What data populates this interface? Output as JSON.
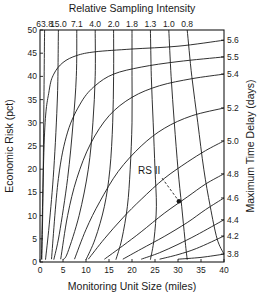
{
  "chart_data": {
    "type": "line",
    "title": "Relative Sampling Intensity",
    "xlabel": "Monitoring Unit Size (miles)",
    "ylabel": "Economic Risk (pct)",
    "y2label": "Maximum Time Delay (days)",
    "xlim": [
      0,
      40
    ],
    "ylim": [
      0,
      50
    ],
    "grid": false,
    "x_ticks": [
      0,
      5,
      10,
      15,
      20,
      25,
      30,
      35,
      40
    ],
    "x_tick_labels": [
      "0",
      "5",
      "10",
      "15",
      "20",
      "25",
      "30",
      "35",
      "40"
    ],
    "y_ticks": [
      0,
      5,
      10,
      15,
      20,
      25,
      30,
      35,
      40,
      45,
      50
    ],
    "y_tick_labels": [
      "0",
      "5",
      "10",
      "15",
      "20",
      "25",
      "30",
      "35",
      "40",
      "45",
      "50"
    ],
    "top_axis": {
      "label": "Relative Sampling Intensity",
      "tick_labels": [
        "63.8",
        "15.0",
        "7.1",
        "4.0",
        "2.0",
        "1.8",
        "1.3",
        "1.0",
        "0.8"
      ],
      "tick_x_miles": [
        1,
        4,
        8,
        12,
        16,
        20,
        24,
        28,
        32
      ]
    },
    "right_axis": {
      "label": "Maximum Time Delay (days)",
      "tick_labels": [
        "5.6",
        "5.5",
        "5.4",
        "5.2",
        "5.0",
        "4.8",
        "4.6",
        "4.4",
        "4.2",
        "3.8"
      ],
      "tick_y_pct": [
        47.8,
        44.2,
        40.5,
        33.2,
        26.1,
        19.0,
        13.8,
        9.1,
        5.6,
        1.7
      ]
    },
    "series_time_delay": [
      {
        "name": "5.6",
        "points": [
          [
            0.3,
            0.6
          ],
          [
            1,
            28
          ],
          [
            2,
            37
          ],
          [
            3,
            40.5
          ],
          [
            5,
            43
          ],
          [
            8,
            44.5
          ],
          [
            12,
            45.3
          ],
          [
            20,
            45.9
          ],
          [
            30,
            46.5
          ],
          [
            40,
            47.8
          ]
        ]
      },
      {
        "name": "5.5",
        "points": [
          [
            2.5,
            0.6
          ],
          [
            4,
            18
          ],
          [
            6,
            28
          ],
          [
            9,
            34.5
          ],
          [
            12,
            38
          ],
          [
            16,
            40.5
          ],
          [
            22,
            42
          ],
          [
            30,
            43.2
          ],
          [
            40,
            44.2
          ]
        ]
      },
      {
        "name": "5.4",
        "points": [
          [
            4.5,
            0.6
          ],
          [
            6,
            10
          ],
          [
            8,
            18
          ],
          [
            11,
            25.5
          ],
          [
            15,
            31.5
          ],
          [
            20,
            35.5
          ],
          [
            26,
            38
          ],
          [
            33,
            39.5
          ],
          [
            40,
            40.5
          ]
        ]
      },
      {
        "name": "5.2",
        "points": [
          [
            7.5,
            0.6
          ],
          [
            10,
            7
          ],
          [
            13,
            13
          ],
          [
            17,
            19.5
          ],
          [
            22,
            25
          ],
          [
            27,
            28.8
          ],
          [
            33,
            31.5
          ],
          [
            40,
            33.2
          ]
        ]
      },
      {
        "name": "5.0",
        "points": [
          [
            10.5,
            0.6
          ],
          [
            14,
            5
          ],
          [
            18,
            9.5
          ],
          [
            22,
            13.5
          ],
          [
            27,
            18
          ],
          [
            32,
            21.5
          ],
          [
            36,
            24
          ],
          [
            40,
            26.1
          ]
        ]
      },
      {
        "name": "4.8",
        "points": [
          [
            14,
            0.6
          ],
          [
            18,
            3.5
          ],
          [
            22,
            6.5
          ],
          [
            27,
            10.5
          ],
          [
            32,
            14
          ],
          [
            36,
            16.8
          ],
          [
            40,
            19
          ]
        ]
      },
      {
        "name": "4.6",
        "points": [
          [
            18,
            0.6
          ],
          [
            22,
            2.8
          ],
          [
            27,
            5.5
          ],
          [
            32,
            8.5
          ],
          [
            36,
            11.3
          ],
          [
            40,
            13.8
          ]
        ]
      },
      {
        "name": "4.4",
        "points": [
          [
            22,
            0.6
          ],
          [
            26,
            2
          ],
          [
            30,
            3.8
          ],
          [
            34,
            5.8
          ],
          [
            40,
            9.1
          ]
        ]
      },
      {
        "name": "4.2",
        "points": [
          [
            26,
            0.6
          ],
          [
            30,
            1.6
          ],
          [
            34,
            2.9
          ],
          [
            40,
            5.6
          ]
        ]
      },
      {
        "name": "3.8",
        "points": [
          [
            30,
            0.6
          ],
          [
            35,
            1
          ],
          [
            40,
            1.7
          ]
        ]
      }
    ],
    "series_sampling_intensity": [
      {
        "name": "63.8",
        "points": [
          [
            1,
            50
          ],
          [
            0.8,
            30
          ],
          [
            0.6,
            12
          ],
          [
            0.4,
            0.5
          ]
        ]
      },
      {
        "name": "15.0",
        "points": [
          [
            4,
            50
          ],
          [
            3.8,
            36
          ],
          [
            3,
            20
          ],
          [
            2,
            8
          ],
          [
            1.2,
            0.5
          ]
        ]
      },
      {
        "name": "7.1",
        "points": [
          [
            8,
            50
          ],
          [
            7.9,
            40
          ],
          [
            7.2,
            30
          ],
          [
            6,
            18
          ],
          [
            4.2,
            6
          ],
          [
            3,
            0.5
          ]
        ]
      },
      {
        "name": "4.0",
        "points": [
          [
            12,
            50
          ],
          [
            12,
            40
          ],
          [
            11.5,
            30
          ],
          [
            10.5,
            20
          ],
          [
            8.5,
            10
          ],
          [
            6,
            2
          ],
          [
            5,
            0.5
          ]
        ]
      },
      {
        "name": "2.0",
        "points": [
          [
            16,
            50
          ],
          [
            16,
            40
          ],
          [
            15.8,
            30
          ],
          [
            15.2,
            20
          ],
          [
            14,
            12
          ],
          [
            12,
            5
          ],
          [
            10,
            0.5
          ]
        ]
      },
      {
        "name": "1.8",
        "points": [
          [
            20,
            50
          ],
          [
            20,
            40
          ],
          [
            20,
            30
          ],
          [
            19.6,
            20
          ],
          [
            19,
            12
          ],
          [
            17.8,
            5
          ],
          [
            16.5,
            0.5
          ]
        ]
      },
      {
        "name": "1.3",
        "points": [
          [
            24,
            50
          ],
          [
            24.2,
            40
          ],
          [
            24.6,
            30
          ],
          [
            25,
            20
          ],
          [
            25.3,
            12
          ],
          [
            24.8,
            5
          ],
          [
            24,
            0.5
          ]
        ]
      },
      {
        "name": "1.0",
        "points": [
          [
            28,
            50
          ],
          [
            28.5,
            40
          ],
          [
            29.2,
            30
          ],
          [
            30,
            20
          ],
          [
            30.8,
            12
          ],
          [
            31.5,
            5
          ],
          [
            32,
            0.5
          ]
        ]
      },
      {
        "name": "0.8",
        "points": [
          [
            32,
            50
          ],
          [
            33,
            40
          ],
          [
            34.3,
            30
          ],
          [
            35.6,
            20
          ],
          [
            37,
            12
          ],
          [
            38.5,
            5
          ],
          [
            40,
            1.7
          ]
        ]
      }
    ],
    "annotations": [
      {
        "text": "RS II",
        "label_at": [
          23.5,
          18.5
        ],
        "point": [
          30.2,
          13.1
        ],
        "marker": "filled-circle",
        "leader": "dashed"
      }
    ]
  }
}
